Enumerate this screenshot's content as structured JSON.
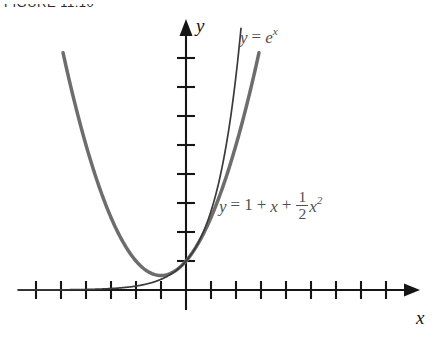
{
  "figure": {
    "caption": "FIGURE 11.10",
    "background_color": "#ffffff",
    "axis_color": "#151515",
    "curve_exp_color": "#3a3a3a",
    "curve_poly_color": "#6d6d6d",
    "label_color": "#4f4f4f"
  },
  "axes": {
    "x_label": "x",
    "y_label": "y",
    "origin": {
      "x": 186,
      "y": 290
    },
    "tick_spacing_x": 25,
    "tick_spacing_y": 29,
    "ticks_x_left": 6,
    "ticks_x_right": 8,
    "ticks_y_up": 8,
    "ticks_y_down": 0,
    "tick_half_length": 8,
    "x_axis_from": 18,
    "x_axis_to": 412,
    "y_axis_from": 310,
    "y_axis_to": 24
  },
  "labels": {
    "exponential": {
      "y": "y",
      "equals": "=",
      "base": "e",
      "exponent": "x"
    },
    "polynomial": {
      "y": "y",
      "equals": "=",
      "one": "1",
      "plus1": "+",
      "x": "x",
      "plus2": "+",
      "frac_num": "1",
      "frac_den": "2",
      "x2_base": "x",
      "x2_exp": "2"
    }
  },
  "chart_data": {
    "type": "line",
    "title": "FIGURE 11.10",
    "xlabel": "x",
    "ylabel": "y",
    "grid": false,
    "legend": "inline-annotations",
    "xlim": [
      -6.7,
      9.0
    ],
    "ylim": [
      -0.7,
      9.2
    ],
    "xticks": [
      -6,
      -5,
      -4,
      -3,
      -2,
      -1,
      1,
      2,
      3,
      4,
      5,
      6,
      7,
      8
    ],
    "yticks": [
      1,
      2,
      3,
      4,
      5,
      6,
      7,
      8
    ],
    "series": [
      {
        "name": "y = e^x",
        "expression": "y = e**x",
        "color": "#3a3a3a",
        "linewidth": 1.4,
        "x": [
          -6.7,
          -6.0,
          -5.0,
          -4.0,
          -3.0,
          -2.0,
          -1.5,
          -1.0,
          -0.5,
          0.0,
          0.5,
          1.0,
          1.5,
          2.0,
          2.2
        ],
        "y": [
          0.0012,
          0.0025,
          0.0067,
          0.018,
          0.05,
          0.135,
          0.223,
          0.368,
          0.607,
          1.0,
          1.649,
          2.718,
          4.482,
          7.389,
          9.025
        ]
      },
      {
        "name": "y = 1 + x + (1/2)x^2",
        "expression": "y = 1 + x + 0.5*x**2",
        "color": "#6d6d6d",
        "linewidth": 3.2,
        "x": [
          -4.9,
          -4.0,
          -3.0,
          -2.0,
          -1.0,
          0.0,
          1.0,
          2.0,
          3.0,
          3.5
        ],
        "y": [
          8.105,
          5.0,
          2.5,
          1.0,
          0.5,
          1.0,
          2.5,
          5.0,
          8.5,
          10.625
        ]
      }
    ],
    "annotations": [
      {
        "text": "y = e^x",
        "x": 2.2,
        "y": 9.0
      },
      {
        "text": "y = 1 + x + (1/2)x^2",
        "x": 1.4,
        "y": 3.6
      }
    ]
  }
}
